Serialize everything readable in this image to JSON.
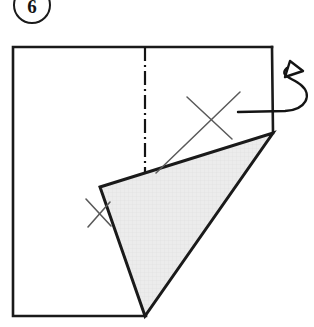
{
  "figure": {
    "step_label": "6",
    "badge_name": "step-number-circle"
  },
  "colors": {
    "outline": "#1a1a1a",
    "fold_fill": "#e9e9e9",
    "fold_fill_texture": "#dcdcdc",
    "annotation": "#555555",
    "centerline": "#141414",
    "background": "#ffffff"
  },
  "geometry": {
    "sheet": {
      "name": "paper-sheet",
      "top_left": [
        13,
        47
      ],
      "top_right": [
        272,
        47
      ],
      "bottom_right_open": [
        273,
        133
      ],
      "bottom_left": [
        13,
        316
      ],
      "bottom_right_edge_end": [
        146,
        316
      ],
      "stroke_width": 2.6
    },
    "center_line": {
      "name": "fold-center-line",
      "x": 145,
      "y_start": 47,
      "y_end": 174,
      "dash_pattern": "14 4 2 4",
      "stroke_width": 2.2
    },
    "folded_flap": {
      "name": "folded-triangle-flap",
      "points": [
        [
          100,
          187
        ],
        [
          273,
          133
        ],
        [
          145,
          316
        ]
      ],
      "stroke_width": 3.0
    },
    "x_mark_large": {
      "name": "x-mark-annotation",
      "stroke_a": [
        [
          156,
          173
        ],
        [
          240,
          92
        ]
      ],
      "stroke_b": [
        [
          187,
          97
        ],
        [
          232,
          139
        ]
      ],
      "stroke_width": 1.5
    },
    "x_mark_small": {
      "name": "tick-mark-annotation",
      "stroke_a": [
        [
          86,
          199
        ],
        [
          110,
          225
        ]
      ],
      "stroke_b": [
        [
          109,
          203
        ],
        [
          88,
          226
        ]
      ],
      "stroke_width": 1.5
    },
    "flip_arrow": {
      "name": "flip-over-arrow",
      "loop_path": "M 240 112 L 286 111 C 308 110 312 96 301 85 C 292 76 277 74 286 67",
      "arrow_head": [
        [
          288,
          62
        ],
        [
          300,
          71
        ],
        [
          284,
          76
        ]
      ],
      "stroke_width": 2.4
    }
  },
  "annotations": {
    "flip_arrow_meaning": "turn over / flip the sheet",
    "centerline_meaning": "fold axis (dash-dot centerline)",
    "x_mark_meaning": "crease reference mark"
  }
}
